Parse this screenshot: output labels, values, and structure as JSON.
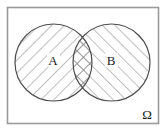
{
  "figure": {
    "kind": "venn-diagram",
    "title": "",
    "background_color": "#ffffff"
  },
  "universe": {
    "name": "universal-set",
    "label": "Ω",
    "label_position": "bottom-right",
    "border_color": "#9a9a9a",
    "fill_color": "#ffffff",
    "rect": {
      "x": 7,
      "y": 7,
      "width": 152,
      "height": 117
    }
  },
  "sets": [
    {
      "id": "A",
      "label": "A",
      "label_x": 53,
      "label_y": 64,
      "circle": {
        "cx": 53.5,
        "cy": 62.5,
        "r": 38.5
      },
      "stroke_color": "#4d4d4d",
      "hatch": {
        "pattern": "diagonal-backslash",
        "angle_deg": 45,
        "spacing": 9,
        "color": "#8a8a8a"
      }
    },
    {
      "id": "B",
      "label": "B",
      "label_x": 111,
      "label_y": 64,
      "circle": {
        "cx": 111.5,
        "cy": 62.5,
        "r": 38.5
      },
      "stroke_color": "#4d4d4d",
      "hatch": {
        "pattern": "diagonal-backslash",
        "angle_deg": 45,
        "spacing": 9,
        "color": "#8a8a8a"
      }
    }
  ],
  "intersection": {
    "id": "A-and-B",
    "label": "",
    "hatch": {
      "pattern": "cross-hatch",
      "color": "#8a8a8a"
    },
    "description": "lens region shaded with both diagonal directions"
  },
  "legend": {
    "visible": false,
    "entries": []
  }
}
